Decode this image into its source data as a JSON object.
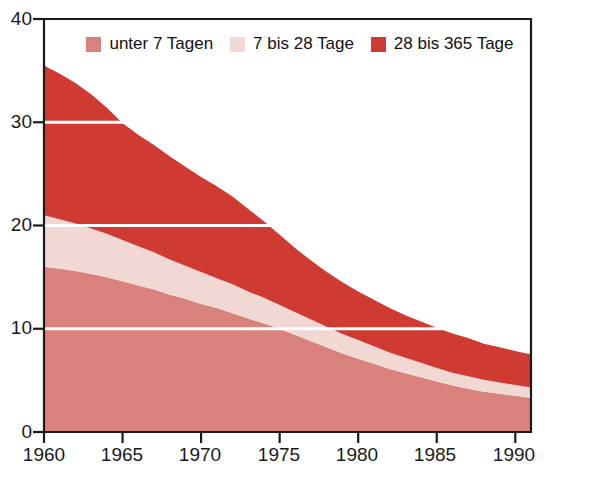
{
  "chart_data": {
    "type": "area",
    "stacked": true,
    "title": "",
    "xlabel": "",
    "ylabel": "",
    "xlim": [
      1960,
      1991
    ],
    "ylim": [
      0,
      40
    ],
    "yticks": [
      0,
      10,
      20,
      30,
      40
    ],
    "xticks": [
      1960,
      1965,
      1970,
      1975,
      1980,
      1985,
      1990
    ],
    "ytick_labels": [
      "0",
      "10",
      "20",
      "30",
      "40"
    ],
    "xtick_labels": [
      "1960",
      "1965",
      "1970",
      "1975",
      "1980",
      "1985",
      "1990"
    ],
    "grid": true,
    "grid_color": "#ffffff",
    "legend_position": "top-center",
    "x": [
      1960,
      1961,
      1962,
      1963,
      1964,
      1965,
      1966,
      1967,
      1968,
      1969,
      1970,
      1971,
      1972,
      1973,
      1974,
      1975,
      1976,
      1977,
      1978,
      1979,
      1980,
      1981,
      1982,
      1983,
      1984,
      1985,
      1986,
      1987,
      1988,
      1989,
      1990,
      1991
    ],
    "series": [
      {
        "name": "unter 7 Tagen",
        "color": "#d9827c",
        "values": [
          16.0,
          15.8,
          15.6,
          15.3,
          15.0,
          14.6,
          14.2,
          13.8,
          13.3,
          12.9,
          12.4,
          12.0,
          11.5,
          11.0,
          10.5,
          10.0,
          9.4,
          8.8,
          8.2,
          7.6,
          7.1,
          6.6,
          6.1,
          5.7,
          5.3,
          4.9,
          4.5,
          4.2,
          3.9,
          3.7,
          3.5,
          3.3
        ]
      },
      {
        "name": "7 bis 28 Tage",
        "color": "#f2d8d4",
        "values": [
          5.0,
          4.8,
          4.6,
          4.4,
          4.2,
          4.0,
          3.8,
          3.6,
          3.4,
          3.2,
          3.1,
          2.9,
          2.8,
          2.6,
          2.5,
          2.3,
          2.2,
          2.1,
          2.0,
          1.9,
          1.8,
          1.7,
          1.6,
          1.5,
          1.4,
          1.3,
          1.25,
          1.2,
          1.15,
          1.1,
          1.05,
          1.0
        ]
      },
      {
        "name": "28 bis 365 Tage",
        "color": "#cf3b33",
        "values": [
          14.5,
          14.1,
          13.6,
          13.0,
          12.2,
          11.3,
          10.8,
          10.4,
          10.0,
          9.6,
          9.2,
          8.9,
          8.5,
          8.0,
          7.4,
          6.8,
          6.2,
          5.7,
          5.3,
          5.0,
          4.7,
          4.5,
          4.3,
          4.1,
          4.0,
          3.9,
          3.8,
          3.7,
          3.5,
          3.4,
          3.3,
          3.2
        ]
      }
    ],
    "totals": [
      35.5,
      34.7,
      33.8,
      32.7,
      31.4,
      29.9,
      28.8,
      27.8,
      26.7,
      25.7,
      24.7,
      23.8,
      22.8,
      21.6,
      20.4,
      19.1,
      17.8,
      16.6,
      15.5,
      14.5,
      13.6,
      12.8,
      12.0,
      11.3,
      10.7,
      10.1,
      9.55,
      9.1,
      8.55,
      8.2,
      7.85,
      7.5
    ]
  },
  "legend": {
    "items": [
      {
        "label": "unter 7 Tagen",
        "swatch_name": "legend-swatch-unter-7-tagen"
      },
      {
        "label": "7 bis 28 Tage",
        "swatch_name": "legend-swatch-7-bis-28-tage"
      },
      {
        "label": "28 bis 365 Tage",
        "swatch_name": "legend-swatch-28-bis-365-tage"
      }
    ]
  },
  "axes": {
    "y_labels": [
      "40",
      "30",
      "20",
      "10",
      "0"
    ],
    "x_labels": [
      "1960",
      "1965",
      "1970",
      "1975",
      "1980",
      "1985",
      "1990"
    ]
  },
  "top_fragment": {
    "text": ""
  },
  "colors": {
    "series_1": "#d9827c",
    "series_2": "#f2d8d4",
    "series_3": "#cf3b33",
    "background": "#ffffff",
    "axis": "#1a1a1a",
    "gridline": "#ffffff",
    "text": "#111111"
  }
}
